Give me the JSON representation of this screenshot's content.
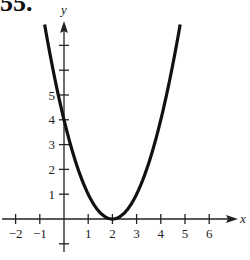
{
  "problem": {
    "number": "55."
  },
  "chart_data": {
    "type": "line",
    "title": "",
    "function": "y = (x - 2)^2",
    "xlabel": "x",
    "ylabel": "y",
    "xlim": [
      -2.6,
      7.1
    ],
    "ylim": [
      -1.3,
      8.1
    ],
    "x_ticks": [
      -2,
      -1,
      1,
      2,
      3,
      4,
      5,
      6
    ],
    "x_tick_labels": [
      "−2",
      "−1",
      "1",
      "2",
      "3",
      "4",
      "5",
      "6"
    ],
    "y_ticks": [
      -1,
      1,
      2,
      3,
      4,
      5,
      6,
      7
    ],
    "y_tick_labels": [
      "1",
      "2",
      "3",
      "4",
      "5"
    ],
    "y_labeled_ticks": [
      1,
      2,
      3,
      4,
      5
    ],
    "grid": false,
    "series": [
      {
        "name": "parabola",
        "x": [
          -0.8,
          -0.5,
          0,
          0.5,
          1,
          1.5,
          2,
          2.5,
          3,
          3.5,
          4,
          4.5,
          4.8
        ],
        "y": [
          7.84,
          6.25,
          4,
          2.25,
          1,
          0.25,
          0,
          0.25,
          1,
          2.25,
          4,
          6.25,
          7.84
        ],
        "vertex": [
          2,
          0
        ],
        "y_intercept": 4
      }
    ],
    "colors": {
      "curve": "#111111",
      "axes": "#222222"
    }
  }
}
